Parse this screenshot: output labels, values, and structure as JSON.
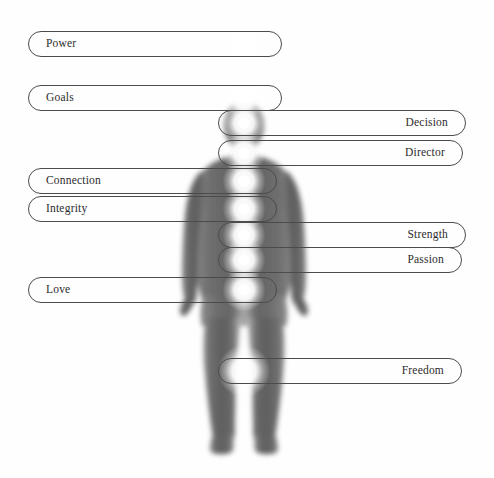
{
  "diagram": {
    "background_color": "#fefefe",
    "figure": {
      "name": "human-silhouette",
      "description": "Grayscale semi-transparent human body silhouette, front view, arms at sides, standing",
      "silhouette_color": "#6e6e6e",
      "chakra_glow_color": "#ffffff"
    },
    "pill": {
      "border_color": "#4b4b4b",
      "text_color": "#2c2c2c"
    },
    "labels": [
      {
        "text": "Power",
        "side": "left",
        "x": 28,
        "y": 31,
        "width": 254,
        "chakra_x": 244,
        "chakra_y": 44,
        "chakra_r": 9
      },
      {
        "text": "Goals",
        "side": "left",
        "x": 28,
        "y": 85,
        "width": 254,
        "chakra_x": 244,
        "chakra_y": 98,
        "chakra_r": 9
      },
      {
        "text": "Decision",
        "side": "right",
        "x": 218,
        "y": 110,
        "width": 248,
        "chakra_x": 244,
        "chakra_y": 123,
        "chakra_r": 9
      },
      {
        "text": "Director",
        "side": "right",
        "x": 218,
        "y": 140,
        "width": 245,
        "chakra_x": 244,
        "chakra_y": 153,
        "chakra_r": 9
      },
      {
        "text": "Connection",
        "side": "left",
        "x": 28,
        "y": 168,
        "width": 249,
        "chakra_x": 244,
        "chakra_y": 181,
        "chakra_r": 9
      },
      {
        "text": "Integrity",
        "side": "left",
        "x": 28,
        "y": 196,
        "width": 249,
        "chakra_x": 244,
        "chakra_y": 209,
        "chakra_r": 9
      },
      {
        "text": "Strength",
        "side": "right",
        "x": 218,
        "y": 222,
        "width": 248,
        "chakra_x": 244,
        "chakra_y": 235,
        "chakra_r": 9
      },
      {
        "text": "Passion",
        "side": "right",
        "x": 218,
        "y": 247,
        "width": 244,
        "chakra_x": 244,
        "chakra_y": 260,
        "chakra_r": 9
      },
      {
        "text": "Love",
        "side": "left",
        "x": 28,
        "y": 277,
        "width": 249,
        "chakra_x": 244,
        "chakra_y": 290,
        "chakra_r": 9
      },
      {
        "text": "Freedom",
        "side": "right",
        "x": 218,
        "y": 358,
        "width": 244,
        "chakra_x": 244,
        "chakra_y": 371,
        "chakra_r": 11
      }
    ]
  }
}
